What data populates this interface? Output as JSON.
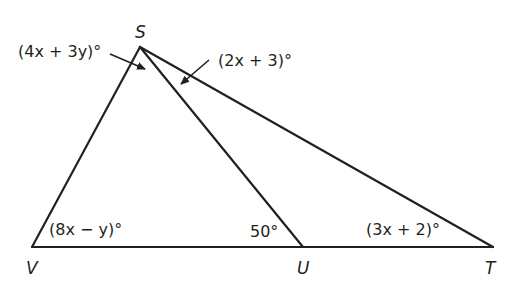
{
  "diagram": {
    "type": "geometry-triangle",
    "vertices": {
      "S": {
        "label": "S",
        "x": 140,
        "y": 47
      },
      "V": {
        "label": "V",
        "x": 32,
        "y": 247
      },
      "U": {
        "label": "U",
        "x": 303,
        "y": 247
      },
      "T": {
        "label": "T",
        "x": 493,
        "y": 247
      }
    },
    "segments": [
      "SV",
      "SU",
      "ST",
      "VT"
    ],
    "angles": {
      "VSU": "(4x + 3y)°",
      "UST": "(2x + 3)°",
      "SVU": "(8x − y)°",
      "SUV": "50°",
      "STU": "(3x + 2)°"
    },
    "line_color": "#231f20"
  }
}
